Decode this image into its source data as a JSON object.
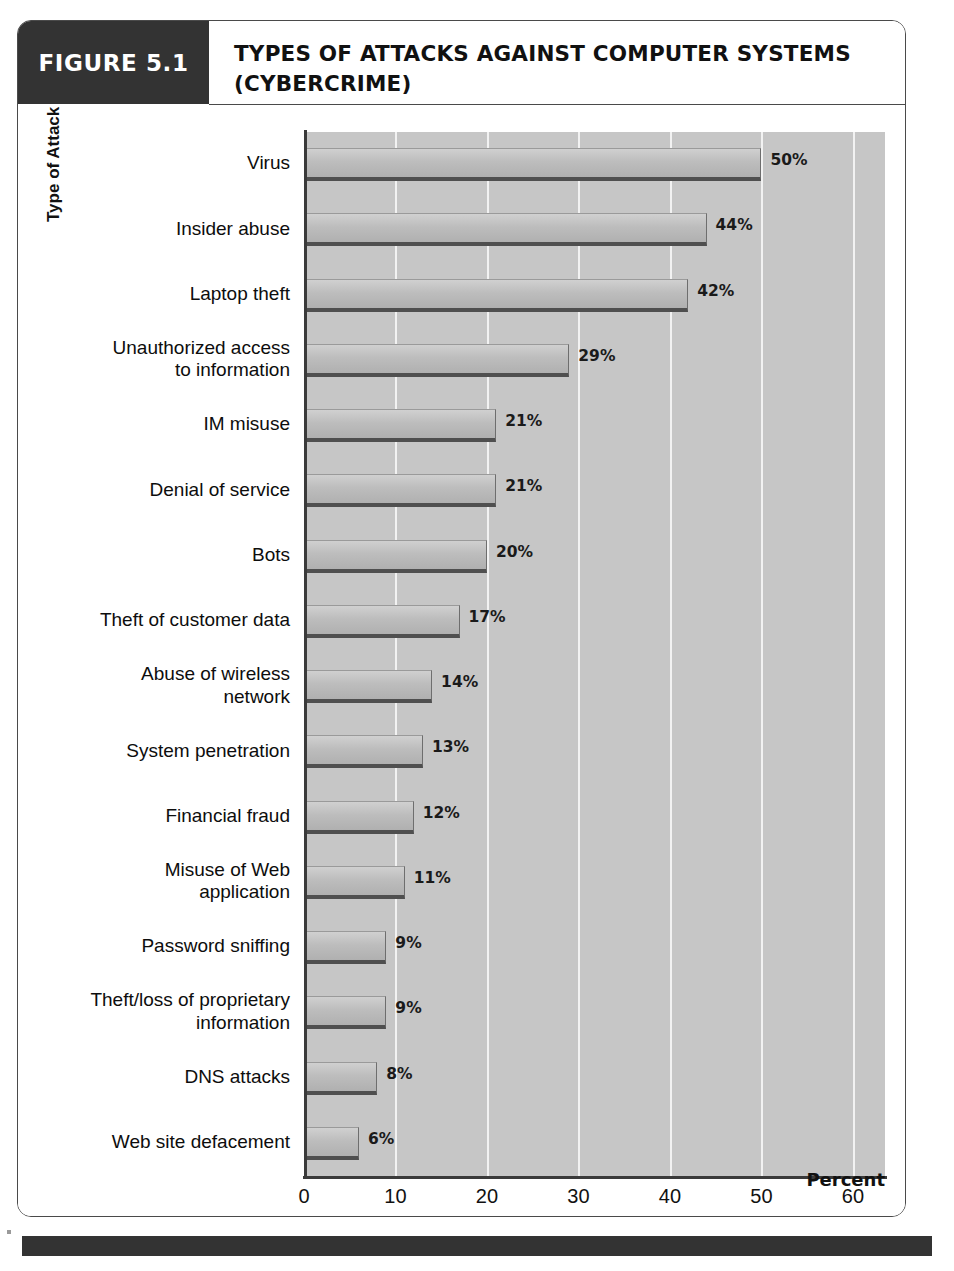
{
  "figure": {
    "number_label": "FIGURE 5.1",
    "title": "TYPES OF ATTACKS AGAINST COMPUTER SYSTEMS (CYBERCRIME)"
  },
  "colors": {
    "header_block": "#333333",
    "frame_border": "#4a4a4a",
    "plot_background": "#c6c6c6",
    "gridline": "#f2f2f2",
    "bar_fill": "#bdbdbd",
    "bar_border": "#4f4f4f",
    "text": "#111111"
  },
  "chart_data": {
    "type": "bar",
    "orientation": "horizontal",
    "title": "TYPES OF ATTACKS AGAINST COMPUTER SYSTEMS (CYBERCRIME)",
    "xlabel": "Percent",
    "ylabel": "Type of Attack",
    "xlim": [
      0,
      63.5
    ],
    "xticks": [
      0,
      10,
      20,
      30,
      40,
      50,
      60
    ],
    "xtick_labels": [
      "0",
      "10",
      "20",
      "30",
      "40",
      "50",
      "60"
    ],
    "grid": "vertical",
    "legend": "none",
    "categories": [
      "Virus",
      "Insider abuse",
      "Laptop theft",
      "Unauthorized access to information",
      "IM misuse",
      "Denial of service",
      "Bots",
      "Theft of customer data",
      "Abuse of wireless network",
      "System penetration",
      "Financial fraud",
      "Misuse of Web application",
      "Password sniffing",
      "Theft/loss of proprietary information",
      "DNS attacks",
      "Web site defacement"
    ],
    "category_lines": [
      [
        "Virus"
      ],
      [
        "Insider abuse"
      ],
      [
        "Laptop theft"
      ],
      [
        "Unauthorized access",
        "to information"
      ],
      [
        "IM misuse"
      ],
      [
        "Denial of service"
      ],
      [
        "Bots"
      ],
      [
        "Theft of customer data"
      ],
      [
        "Abuse of wireless",
        "network"
      ],
      [
        "System penetration"
      ],
      [
        "Financial fraud"
      ],
      [
        "Misuse of Web",
        "application"
      ],
      [
        "Password sniffing"
      ],
      [
        "Theft/loss of proprietary",
        "information"
      ],
      [
        "DNS attacks"
      ],
      [
        "Web site defacement"
      ]
    ],
    "values": [
      50,
      44,
      42,
      29,
      21,
      21,
      20,
      17,
      14,
      13,
      12,
      11,
      9,
      9,
      8,
      6
    ],
    "value_labels": [
      "50%",
      "44%",
      "42%",
      "29%",
      "21%",
      "21%",
      "20%",
      "17%",
      "14%",
      "13%",
      "12%",
      "11%",
      "9%",
      "9%",
      "8%",
      "6%"
    ]
  }
}
